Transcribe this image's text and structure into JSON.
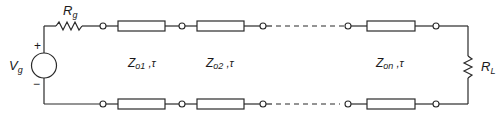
{
  "diagram": {
    "source": {
      "label": "V",
      "label_sub": "g",
      "plus": "+",
      "minus": "−"
    },
    "source_resistor": {
      "label": "R",
      "label_sub": "g"
    },
    "load_resistor": {
      "label": "R",
      "label_sub": "L"
    },
    "sections": [
      {
        "label": "Z",
        "label_sub": "o1",
        "suffix": " ,τ"
      },
      {
        "label": "Z",
        "label_sub": "o2",
        "suffix": " ,τ"
      },
      {
        "label": "Z",
        "label_sub": "on",
        "suffix": " ,τ"
      }
    ],
    "colors": {
      "line": "#2a2a2a",
      "background": "#ffffff"
    }
  }
}
